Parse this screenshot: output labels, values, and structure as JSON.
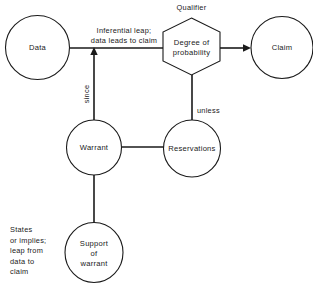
{
  "diagram": {
    "background_color": "#ffffff",
    "line_color": "#1a1a1a",
    "nodes": {
      "data": {
        "label": "Data",
        "shape": "circle"
      },
      "qualifier": {
        "label_line1": "Degree of",
        "label_line2": "probability",
        "shape": "hexagon"
      },
      "claim": {
        "label": "Claim",
        "shape": "circle"
      },
      "warrant": {
        "label": "Warrant",
        "shape": "circle"
      },
      "reservations": {
        "label": "Reservations",
        "shape": "circle"
      },
      "support": {
        "label_line1": "Support",
        "label_line2": "of",
        "label_line3": "warrant",
        "shape": "circle"
      }
    },
    "labels": {
      "qualifier_caption": "Qualifier",
      "inferential_line1": "Inferential leap;",
      "inferential_line2": "data leads to claim",
      "since": "since",
      "unless": "unless",
      "states_line1": "States",
      "states_line2": "or implies;",
      "states_line3": "leap from",
      "states_line4": "data to",
      "states_line5": "claim"
    }
  }
}
